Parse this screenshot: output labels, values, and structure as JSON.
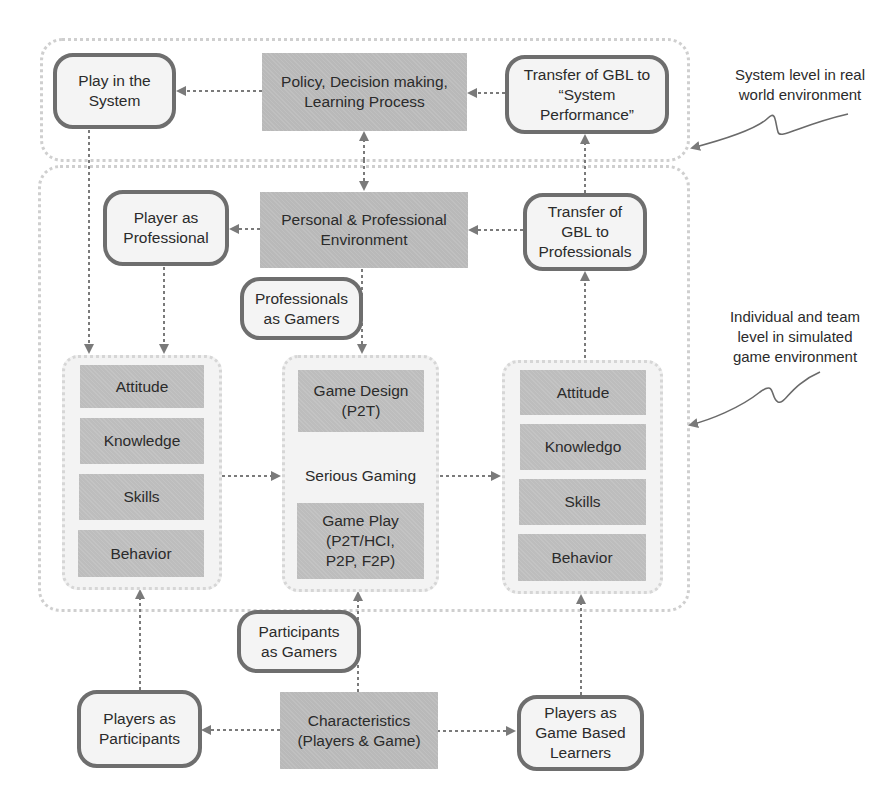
{
  "diagram": {
    "levels": {
      "system_level_note": "System level in real\nworld environment",
      "individual_level_note": "Individual and team\nlevel in simulated\ngame environment"
    },
    "system_row": {
      "play_in_system": "Play in the\nSystem",
      "policy": "Policy, Decision making,\nLearning Process",
      "transfer_system": "Transfer of GBL to\n“System\nPerformance”"
    },
    "professional_row": {
      "player_as_professional": "Player as\nProfessional",
      "personal_professional_env": "Personal & Professional\nEnvironment",
      "transfer_professionals": "Transfer of\nGBL to\nProfessionals",
      "professionals_as_gamers": "Professionals\nas Gamers"
    },
    "left_column": {
      "items": [
        "Attitude",
        "Knowledge",
        "Skills",
        "Behavior"
      ]
    },
    "center_column": {
      "game_design": "Game Design\n(P2T)",
      "serious_gaming": "Serious Gaming",
      "game_play": "Game Play\n(P2T/HCI,\nP2P, F2P)"
    },
    "right_column": {
      "items": [
        "Attitude",
        "Knowledgo",
        "Skills",
        "Behavior"
      ]
    },
    "bottom_row": {
      "participants_as_gamers": "Participants\nas Gamers",
      "players_as_participants": "Players as\nParticipants",
      "characteristics": "Characteristics\n(Players & Game)",
      "players_as_gbl": "Players as\nGame Based\nLearners"
    },
    "colors": {
      "shaded_fill": "#b9b9b9",
      "rounded_border": "#6e6e6e",
      "rounded_fill": "#f4f4f4",
      "container_border": "#cfcfcf",
      "arrow": "#7a7a7a"
    }
  }
}
